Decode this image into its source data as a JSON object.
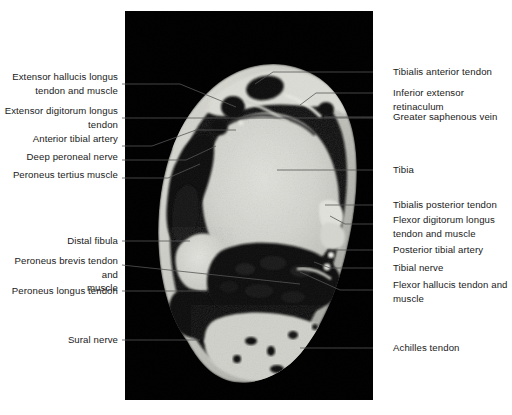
{
  "figure": {
    "background_color": "#ffffff",
    "panel": {
      "x": 125,
      "y": 11,
      "width": 248,
      "height": 389,
      "background_color": "#000000"
    },
    "leader_color": "#555555",
    "text_color": "#1a1a1a"
  },
  "labels_left": [
    {
      "name": "extensor-hallucis-longus",
      "text": "Extensor hallucis longus\ntendon and muscle",
      "text_right_x": 118,
      "text_top_y": 70,
      "leader": [
        [
          122,
          84
        ],
        [
          180,
          84
        ],
        [
          236,
          107
        ]
      ]
    },
    {
      "name": "extensor-digitorum-longus",
      "text": "Extensor digitorum longus\ntendon",
      "text_right_x": 118,
      "text_top_y": 104,
      "leader": [
        [
          122,
          118
        ],
        [
          373,
          118
        ]
      ]
    },
    {
      "name": "anterior-tibial-artery",
      "text": "Anterior tibial artery",
      "text_right_x": 118,
      "text_top_y": 132,
      "leader": [
        [
          122,
          146
        ],
        [
          152,
          146
        ],
        [
          196,
          130
        ],
        [
          236,
          130
        ]
      ]
    },
    {
      "name": "deep-peroneal-nerve",
      "text": "Deep peroneal nerve",
      "text_right_x": 118,
      "text_top_y": 150,
      "leader": [
        [
          122,
          160
        ],
        [
          186,
          160
        ],
        [
          216,
          146
        ]
      ]
    },
    {
      "name": "peroneus-tertius-muscle",
      "text": "Peroneus tertius muscle",
      "text_right_x": 118,
      "text_top_y": 168,
      "leader": [
        [
          122,
          178
        ],
        [
          168,
          178
        ],
        [
          200,
          164
        ]
      ]
    },
    {
      "name": "distal-fibula",
      "text": "Distal fibula",
      "text_right_x": 118,
      "text_top_y": 234,
      "leader": [
        [
          122,
          241
        ],
        [
          190,
          241
        ]
      ]
    },
    {
      "name": "peroneus-brevis-tendon-and-muscle",
      "text": "Peroneus brevis tendon and\nmuscle",
      "text_right_x": 118,
      "text_top_y": 254,
      "leader": [
        [
          122,
          265
        ],
        [
          300,
          284
        ]
      ]
    },
    {
      "name": "peroneus-longus-tendon",
      "text": "Peroneus longus tendon",
      "text_right_x": 118,
      "text_top_y": 284,
      "leader": [
        [
          122,
          291
        ],
        [
          206,
          291
        ]
      ]
    },
    {
      "name": "sural-nerve",
      "text": "Sural nerve",
      "text_right_x": 118,
      "text_top_y": 333,
      "leader": [
        [
          122,
          340
        ],
        [
          200,
          340
        ]
      ]
    }
  ],
  "labels_right": [
    {
      "name": "tibialis-anterior-tendon",
      "text": "Tibialis anterior tendon",
      "text_left_x": 393,
      "text_top_y": 65,
      "leader": [
        [
          373,
          72
        ],
        [
          273,
          72
        ],
        [
          255,
          84
        ]
      ]
    },
    {
      "name": "inferior-extensor-retinaculum",
      "text": "Inferior extensor retinaculum",
      "text_left_x": 393,
      "text_top_y": 86,
      "leader": [
        [
          373,
          93
        ],
        [
          316,
          93
        ],
        [
          300,
          105
        ]
      ]
    },
    {
      "name": "greater-saphenous-vein",
      "text": "Greater saphenous vein",
      "text_left_x": 393,
      "text_top_y": 110,
      "leader": [
        [
          373,
          117
        ],
        [
          324,
          117
        ]
      ]
    },
    {
      "name": "tibia",
      "text": "Tibia",
      "text_left_x": 393,
      "text_top_y": 163,
      "leader": [
        [
          373,
          170
        ],
        [
          277,
          170
        ]
      ]
    },
    {
      "name": "tibialis-posterior-tendon",
      "text": "Tibialis posterior tendon",
      "text_left_x": 393,
      "text_top_y": 198,
      "leader": [
        [
          373,
          205
        ],
        [
          325,
          205
        ]
      ]
    },
    {
      "name": "flexor-digitorum-longus",
      "text": "Flexor digitorum longus\ntendon and muscle",
      "text_left_x": 393,
      "text_top_y": 213,
      "leader": [
        [
          373,
          224
        ],
        [
          345,
          224
        ],
        [
          330,
          216
        ]
      ]
    },
    {
      "name": "posterior-tibial-artery",
      "text": "Posterior tibial artery",
      "text_left_x": 393,
      "text_top_y": 243,
      "leader": [
        [
          373,
          250
        ],
        [
          327,
          250
        ]
      ]
    },
    {
      "name": "tibial-nerve",
      "text": "Tibial nerve",
      "text_left_x": 393,
      "text_top_y": 261,
      "leader": [
        [
          373,
          268
        ],
        [
          330,
          268
        ],
        [
          314,
          262
        ]
      ]
    },
    {
      "name": "flexor-hallucis-tendon-and-muscle",
      "text": "Flexor hallucis tendon and\nmuscle",
      "text_left_x": 393,
      "text_top_y": 278,
      "leader": [
        [
          373,
          290
        ],
        [
          340,
          290
        ],
        [
          300,
          272
        ]
      ]
    },
    {
      "name": "achilles-tendon",
      "text": "Achilles tendon",
      "text_left_x": 393,
      "text_top_y": 341,
      "leader": [
        [
          373,
          348
        ],
        [
          300,
          348
        ]
      ]
    }
  ],
  "mri": {
    "modality": "MRI",
    "view": "axial cross-section of ankle",
    "panel_background": "#000000",
    "bone_bright": "#d8d8d4",
    "soft_tissue": "#b9b9b4",
    "fat_bright": "#e8e8e4",
    "dark_tissue": "#131313"
  }
}
